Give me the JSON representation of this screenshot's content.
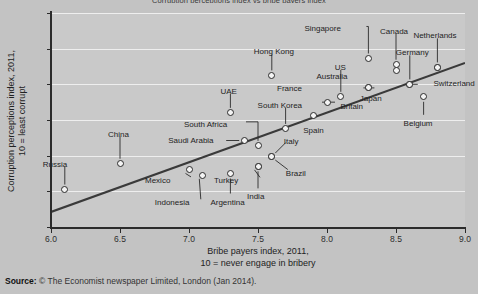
{
  "chart_data": {
    "type": "scatter",
    "title": "Corruption perceptions index vs bribe payers index",
    "xlabel_line1": "Bribe payers index, 2011,",
    "xlabel_line2": "10 = never engage in bribery",
    "ylabel_line1": "Corruption perceptions index, 2011,",
    "ylabel_line2": "10 = least corrupt",
    "xlim": [
      6.0,
      9.0
    ],
    "ylim": [
      0,
      12
    ],
    "xticks": [
      "6.0",
      "6.5",
      "7.0",
      "7.5",
      "8.0",
      "8.5",
      "9.0"
    ],
    "xtick_values": [
      6.0,
      6.5,
      7.0,
      7.5,
      8.0,
      8.5,
      9.0
    ],
    "yticks": [
      "0",
      "2",
      "4",
      "6",
      "8",
      "10",
      "12"
    ],
    "ytick_values": [
      0,
      2,
      4,
      6,
      8,
      10,
      12
    ],
    "grid": "horizontal",
    "legend": "none",
    "trendline": {
      "x0": 6.0,
      "y0": 0.85,
      "x1": 9.0,
      "y1": 9.2
    },
    "points": [
      {
        "name": "Russia",
        "x": 6.1,
        "y": 2.1,
        "label_dx": -22,
        "label_dy": -26,
        "leader": "down"
      },
      {
        "name": "China",
        "x": 6.5,
        "y": 3.55,
        "label_dx": -12,
        "label_dy": -30,
        "leader": "down"
      },
      {
        "name": "Mexico",
        "x": 7.0,
        "y": 3.2,
        "label_dx": -44,
        "label_dy": 10,
        "leader": "diag-left"
      },
      {
        "name": "Indonesia",
        "x": 7.1,
        "y": 2.9,
        "label_dx": -48,
        "label_dy": 27,
        "leader": "diag-left"
      },
      {
        "name": "Argentina",
        "x": 7.3,
        "y": 3.0,
        "label_dx": -20,
        "label_dy": 28,
        "leader": "down"
      },
      {
        "name": "UAE",
        "x": 7.3,
        "y": 6.4,
        "label_dx": -10,
        "label_dy": -22,
        "leader": "down"
      },
      {
        "name": "Saudi Arabia",
        "x": 7.4,
        "y": 4.85,
        "label_dx": -76,
        "label_dy": -1,
        "leader": "left"
      },
      {
        "name": "South Africa",
        "x": 7.5,
        "y": 4.55,
        "label_dx": -74,
        "label_dy": -22,
        "leader": "elbow-left"
      },
      {
        "name": "Turkey",
        "x": 7.5,
        "y": 3.4,
        "label_dx": -44,
        "label_dy": 14,
        "leader": "diag-left"
      },
      {
        "name": "India",
        "x": 7.5,
        "y": 3.4,
        "label_dx": -11,
        "label_dy": 30,
        "leader": "down"
      },
      {
        "name": "Italy",
        "x": 7.6,
        "y": 3.95,
        "label_dx": 12,
        "label_dy": -16,
        "leader": "diag-right"
      },
      {
        "name": "Brazil",
        "x": 7.6,
        "y": 3.95,
        "label_dx": 14,
        "label_dy": 16,
        "leader": "diag-right"
      },
      {
        "name": "Hong Kong",
        "x": 7.6,
        "y": 8.5,
        "label_dx": -18,
        "label_dy": -24,
        "leader": "down"
      },
      {
        "name": "South Korea",
        "x": 7.7,
        "y": 5.5,
        "label_dx": -28,
        "label_dy": -24,
        "leader": "down"
      },
      {
        "name": "Spain",
        "x": 7.9,
        "y": 6.25,
        "label_dx": -10,
        "label_dy": 14,
        "leader": "none"
      },
      {
        "name": "France",
        "x": 8.0,
        "y": 7.0,
        "label_dx": -50,
        "label_dy": -14,
        "leader": "left"
      },
      {
        "name": "US",
        "x": 8.1,
        "y": 7.3,
        "label_dx": -6,
        "label_dy": -30,
        "leader": "down"
      },
      {
        "name": "Australia",
        "x": 8.3,
        "y": 7.8,
        "label_dx": -52,
        "label_dy": -12,
        "leader": "left"
      },
      {
        "name": "Britain",
        "x": 8.3,
        "y": 7.8,
        "label_dx": -28,
        "label_dy": 18,
        "leader": "none"
      },
      {
        "name": "Singapore",
        "x": 8.3,
        "y": 9.45,
        "label_dx": -64,
        "label_dy": -30,
        "leader": "elbow-left"
      },
      {
        "name": "Canada",
        "x": 8.5,
        "y": 9.1,
        "label_dx": -16,
        "label_dy": -34,
        "leader": "down"
      },
      {
        "name": "Canada2",
        "x": 8.5,
        "y": 8.8,
        "label_dx": 0,
        "label_dy": 0,
        "leader": "none"
      },
      {
        "name": "Germany",
        "x": 8.6,
        "y": 8.0,
        "label_dx": -14,
        "label_dy": -32,
        "leader": "down"
      },
      {
        "name": "Japan",
        "x": 8.6,
        "y": 8.0,
        "label_dx": -50,
        "label_dy": 14,
        "leader": "left"
      },
      {
        "name": "Belgium",
        "x": 8.7,
        "y": 7.3,
        "label_dx": -20,
        "label_dy": 26,
        "leader": "down"
      },
      {
        "name": "Netherlands",
        "x": 8.8,
        "y": 8.95,
        "label_dx": -24,
        "label_dy": -32,
        "leader": "down"
      },
      {
        "name": "Switzerland",
        "x": 8.8,
        "y": 8.95,
        "label_dx": -4,
        "label_dy": 16,
        "leader": "none"
      }
    ]
  },
  "source": {
    "prefix": "Source:",
    "text": "© The Economist newspaper Limited, London (Jan 2014)."
  }
}
